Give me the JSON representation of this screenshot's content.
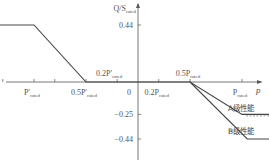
{
  "chart_data": {
    "type": "line",
    "title": "",
    "xlabel": "P",
    "ylabel": "Q/S_rated",
    "ylabel_parts": {
      "main": "Q/S",
      "sub": "rated"
    },
    "xlabel_text": "P",
    "x_ticks": [
      {
        "value": -1.0,
        "main": "P′",
        "sub": "rated",
        "position": "below"
      },
      {
        "value": -0.5,
        "main": "0.5P′",
        "sub": "rated",
        "position": "below"
      },
      {
        "value": -0.2,
        "main": "0.2P′",
        "sub": "rated",
        "position": "above"
      },
      {
        "value": 0,
        "main": "0",
        "sub": "",
        "position": "below"
      },
      {
        "value": 0.2,
        "main": "0.2P",
        "sub": "rated",
        "position": "below"
      },
      {
        "value": 0.5,
        "main": "0.5P",
        "sub": "rated",
        "position": "above"
      },
      {
        "value": 1.0,
        "main": "P",
        "sub": "rated",
        "position": "below"
      }
    ],
    "y_ticks": [
      {
        "value": 0.44,
        "label": "0.44"
      },
      {
        "value": -0.25,
        "label": "−0.25"
      },
      {
        "value": -0.44,
        "label": "−0.44"
      }
    ],
    "xlim": [
      -1.45,
      1.3
    ],
    "ylim": [
      -0.6,
      0.56
    ],
    "series": [
      {
        "name": "A级性能",
        "style": "solid",
        "points": [
          [
            -1.45,
            0.44
          ],
          [
            -1.0,
            0.44
          ],
          [
            -0.5,
            0
          ],
          [
            0.5,
            0
          ],
          [
            1.0,
            -0.25
          ],
          [
            1.3,
            -0.25
          ]
        ],
        "dashed_tail": [
          [
            1.0,
            -0.25
          ],
          [
            1.3,
            -0.25
          ]
        ]
      },
      {
        "name": "B级性能",
        "style": "solid",
        "points": [
          [
            0.5,
            0
          ],
          [
            1.05,
            -0.44
          ],
          [
            1.3,
            -0.44
          ]
        ]
      }
    ],
    "legend": [
      {
        "label": "A级性能",
        "placement": "right"
      },
      {
        "label": "B级性能",
        "placement": "right"
      }
    ],
    "grid": false
  }
}
